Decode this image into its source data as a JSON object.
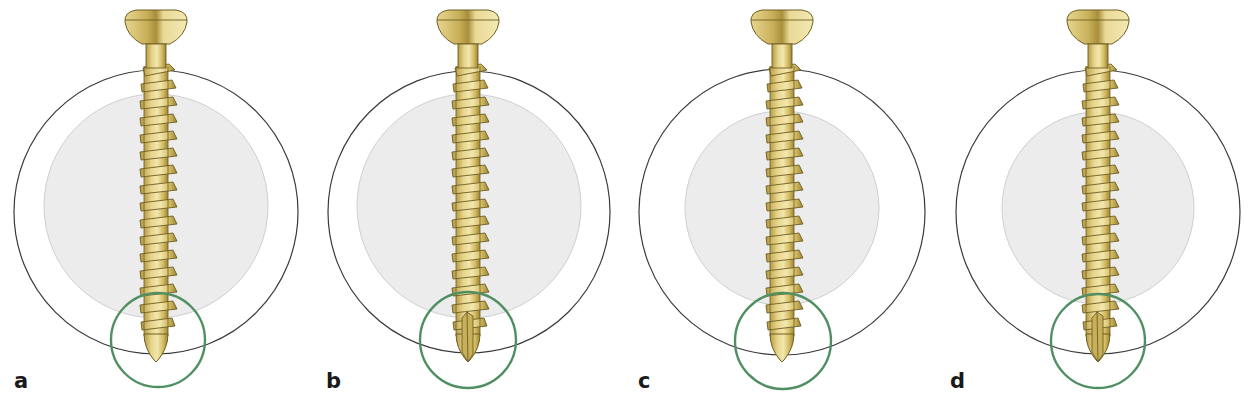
{
  "figure": {
    "colors": {
      "outer_circle": "#3a3a3a",
      "inner_disc_fill": "#ececec",
      "inner_disc_stroke": "#cfcfcf",
      "highlight_circle": "#4f8f62",
      "screw_light": "#efe2a0",
      "screw_mid": "#d9c36a",
      "screw_dark": "#a8923c",
      "screw_outline": "#6e5e22",
      "label_text": "#1a1a1a"
    },
    "panels": [
      {
        "label": "a",
        "tip": "standard",
        "inner_disc": "large"
      },
      {
        "label": "b",
        "tip": "self-tapping",
        "inner_disc": "large"
      },
      {
        "label": "c",
        "tip": "standard",
        "inner_disc": "small"
      },
      {
        "label": "d",
        "tip": "self-tapping",
        "inner_disc": "small"
      }
    ]
  }
}
